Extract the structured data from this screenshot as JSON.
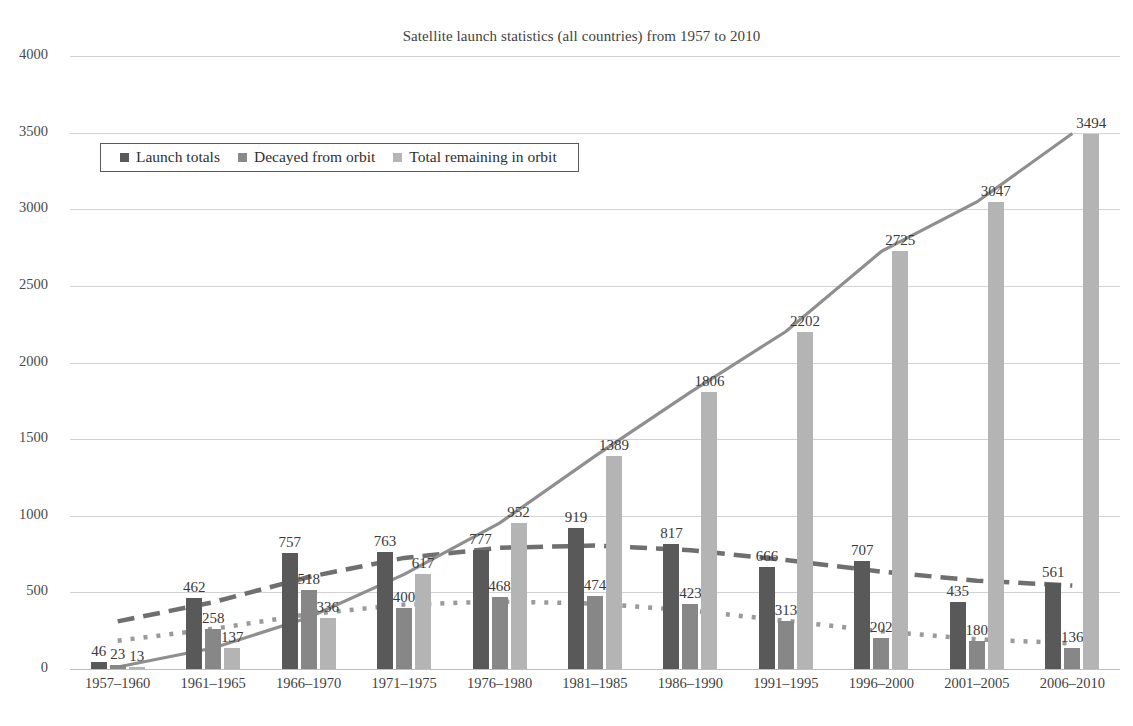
{
  "chart_data": {
    "type": "bar",
    "title": "Satellite launch statistics (all countries) from 1957 to 2010",
    "xlabel": "",
    "ylabel": "",
    "ylim": [
      0,
      4000
    ],
    "ytick_values": [
      4000,
      3500,
      3000,
      2500,
      2000,
      1500,
      1000,
      500,
      0
    ],
    "ytick_labels": [
      "4000",
      "3500",
      "3000",
      "2500",
      "2000",
      "1500",
      "1000",
      "500",
      "0"
    ],
    "grid": true,
    "legend_position": "upper-left-inside",
    "categories": [
      "1957–1960",
      "1961–1965",
      "1966–1970",
      "1971–1975",
      "1976–1980",
      "1981–1985",
      "1986–1990",
      "1991–1995",
      "1996–2000",
      "2001–2005",
      "2006–2010"
    ],
    "series": [
      {
        "name": "Launch totals",
        "color": "#595959",
        "trendline": "long-dashed",
        "values": [
          46,
          462,
          757,
          763,
          777,
          919,
          817,
          666,
          707,
          435,
          561
        ],
        "labels": [
          "46",
          "462",
          "757",
          "763",
          "777",
          "919",
          "817",
          "666",
          "707",
          "435",
          "561"
        ]
      },
      {
        "name": "Decayed from orbit",
        "color": "#878787",
        "trendline": "dotted",
        "values": [
          23,
          258,
          518,
          400,
          468,
          474,
          423,
          313,
          202,
          180,
          136
        ],
        "labels": [
          "23",
          "258",
          "518",
          "400",
          "468",
          "474",
          "423",
          "313",
          "202",
          "180",
          "136"
        ]
      },
      {
        "name": "Total remaining in orbit",
        "color": "#b4b4b4",
        "trendline": "solid",
        "values": [
          13,
          137,
          336,
          617,
          952,
          1389,
          1806,
          2202,
          2725,
          3047,
          3494
        ],
        "labels": [
          "13",
          "137",
          "336",
          "617",
          "952",
          "1389",
          "1806",
          "2202",
          "2725",
          "3047",
          "3494"
        ]
      }
    ]
  },
  "legend": {
    "items": [
      {
        "label": "Launch totals"
      },
      {
        "label": "Decayed from orbit"
      },
      {
        "label": "Total remaining in orbit"
      }
    ]
  }
}
